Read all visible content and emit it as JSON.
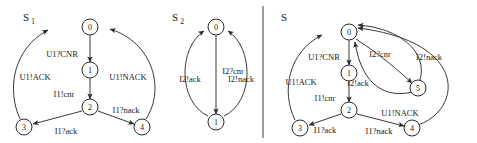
{
  "figure": {
    "caption_present": false,
    "panels": [
      {
        "id": "s1",
        "title": "S",
        "subscript": "1",
        "title_x": 26,
        "title_y": 17,
        "nodes": [
          {
            "label": "0",
            "x": 90,
            "y": 27,
            "r": 8
          },
          {
            "label": "1",
            "x": 90,
            "y": 70,
            "r": 8
          },
          {
            "label": "2",
            "x": 90,
            "y": 107,
            "r": 8
          },
          {
            "label": "3",
            "x": 24,
            "y": 127,
            "r": 8
          },
          {
            "label": "4",
            "x": 142,
            "y": 127,
            "r": 8
          }
        ],
        "edges": [
          {
            "label": "U1?CNR",
            "path": "M 90 35 L 90 62",
            "label_x": 62,
            "label_y": 54,
            "arrow": "down"
          },
          {
            "label": "I1!cnr",
            "path": "M 90 78 L 90 99",
            "label_x": 64,
            "label_y": 94,
            "arrow": "down"
          },
          {
            "label": "I1?ack",
            "path": "M 82 111 L 33 124",
            "label_x": 66,
            "label_y": 131,
            "arrow": "to3"
          },
          {
            "label": "I1?nack",
            "path": "M 98 111 L 134 124",
            "label_x": 126,
            "label_y": 110,
            "arrow": "to4"
          },
          {
            "label": "U1!ACK",
            "path": "M 20 119 C 6 88 14 48 48 30",
            "label_x": 35,
            "label_y": 77,
            "arrow": "to0L"
          },
          {
            "label": "U1!NACK",
            "path": "M 146 119 C 166 88 152 42 110 29",
            "label_x": 128,
            "label_y": 77,
            "arrow": "to0R"
          }
        ]
      },
      {
        "id": "s2",
        "title": "S",
        "subscript": "2",
        "title_x": 175,
        "title_y": 17,
        "nodes": [
          {
            "label": "0",
            "x": 216,
            "y": 27,
            "r": 8
          },
          {
            "label": "1",
            "x": 216,
            "y": 122,
            "r": 8
          }
        ],
        "edges": [
          {
            "label": "I2?cnr",
            "path": "M 216 35 L 216 114",
            "label_x": 233,
            "label_y": 71,
            "arrow": "down"
          },
          {
            "label": "I2!ack",
            "path": "M 208 116 C 178 102 178 48 204 31",
            "label_x": 190,
            "label_y": 79,
            "arrow": "to0L"
          },
          {
            "label": "I2!nack",
            "path": "M 224 116 C 254 102 254 48 228 31",
            "label_x": 241,
            "label_y": 79,
            "arrow": "to0R"
          }
        ]
      },
      {
        "id": "s",
        "title": "S",
        "subscript": "",
        "title_x": 284,
        "title_y": 17,
        "nodes": [
          {
            "label": "0",
            "x": 349,
            "y": 32,
            "r": 8
          },
          {
            "label": "1",
            "x": 349,
            "y": 73,
            "r": 8
          },
          {
            "label": "2",
            "x": 349,
            "y": 110,
            "r": 8
          },
          {
            "label": "3",
            "x": 300,
            "y": 128,
            "r": 8
          },
          {
            "label": "4",
            "x": 412,
            "y": 128,
            "r": 8
          },
          {
            "label": "5",
            "x": 418,
            "y": 88,
            "r": 8
          }
        ],
        "edges": [
          {
            "label": "U1?CNR",
            "path": "M 349 40 L 349 65",
            "label_x": 324,
            "label_y": 57,
            "arrow": "down"
          },
          {
            "label": "I1!cnr",
            "path": "M 349 81 L 349 102",
            "label_x": 325,
            "label_y": 98,
            "arrow": "down"
          },
          {
            "label": "I1?ack",
            "path": "M 341 114 L 309 125",
            "label_x": 325,
            "label_y": 130,
            "arrow": "to3"
          },
          {
            "label": "I1?nack",
            "path": "M 357 114 L 404 126",
            "label_x": 379,
            "label_y": 131,
            "arrow": "to4"
          },
          {
            "label": "U1!ACK",
            "path": "M 295 120 C 281 92 288 52 322 35",
            "label_x": 301,
            "label_y": 82,
            "arrow": "to0L"
          },
          {
            "label": "U1!NACK",
            "path": "M 418 125 C 462 110 470 42 358 28",
            "label_x": 400,
            "label_y": 113,
            "arrow": "to0TR"
          },
          {
            "label": "I2?cnr",
            "path": "M 356 39 C 382 56 400 72 412 83",
            "label_x": 380,
            "label_y": 54,
            "arrow": "to5"
          },
          {
            "label": "I2!ack",
            "path": "M 412 92 C 388 98 362 88 355 42",
            "label_x": 358,
            "label_y": 83,
            "arrow": "to0B"
          },
          {
            "label": "I2!nack",
            "path": "M 420 80 C 428 52 400 28 358 25",
            "label_x": 429,
            "label_y": 57,
            "arrow": "to0T"
          }
        ]
      }
    ],
    "divider": {
      "x": 263,
      "y1": 6,
      "y2": 138
    }
  }
}
